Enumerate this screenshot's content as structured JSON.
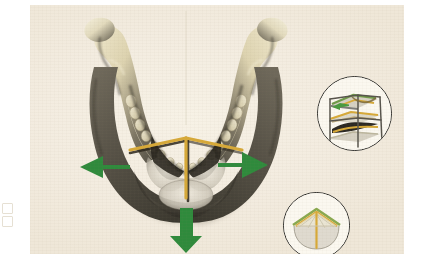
{
  "figure": {
    "alt_text": "Anatomical photograph of a human mandible seen from above with green arrows and gold geometric overlay",
    "background_color": "#f3ece0",
    "plate_color": "#f5efe3"
  },
  "specimen": {
    "name": "mandible",
    "bone_light_color": "#e8e0c6",
    "bone_mid_color": "#9c9480",
    "bone_dark_color": "#4e4a3e",
    "bone_shadow_color": "#35322a"
  },
  "overlay": {
    "color": "#d7a938",
    "outline_color": "#3a3226",
    "elements": [
      {
        "name": "left-ramus-line",
        "label": "left oblique strut"
      },
      {
        "name": "right-ramus-line",
        "label": "right oblique strut"
      },
      {
        "name": "symphysis-line",
        "label": "midline vertical strut"
      }
    ]
  },
  "arrows": {
    "color": "#2f8a3c",
    "items": [
      {
        "name": "arrow-left",
        "direction": "left",
        "label": "lateral expansion left"
      },
      {
        "name": "arrow-right",
        "direction": "right",
        "label": "lateral expansion right"
      },
      {
        "name": "arrow-down",
        "direction": "down",
        "label": "anterior advancement"
      }
    ]
  },
  "insets": [
    {
      "id": "upper",
      "name": "inset-upper",
      "label": "Layered slab schematic",
      "border_color": "#2b2b28",
      "fill_color": "#fbf8f0",
      "accent_green": "#6f9a49",
      "accent_gold": "#d7a938",
      "accent_dark": "#3a3630"
    },
    {
      "id": "lower",
      "name": "inset-lower",
      "label": "Arch / tent schematic",
      "border_color": "#2b2b28",
      "fill_color": "#fbf8f0",
      "accent_green": "#8aa94f",
      "accent_gold": "#d7a938",
      "accent_dark": "#b9b9b4"
    }
  ],
  "margin_marks": [
    {
      "name": "margin-mark-1"
    },
    {
      "name": "margin-mark-2"
    }
  ]
}
